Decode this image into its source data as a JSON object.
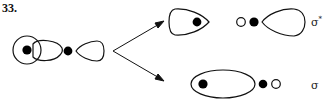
{
  "figure": {
    "number": "33."
  },
  "labels": {
    "antibonding": "σ",
    "antibonding_sup": "*",
    "bonding": "σ"
  },
  "colors": {
    "stroke": "#111111",
    "filled_nucleus": "#000000",
    "background": "#ffffff"
  },
  "legend": {
    "filled_circle": "nucleus (filled)",
    "open_circle": "nucleus (open)"
  }
}
